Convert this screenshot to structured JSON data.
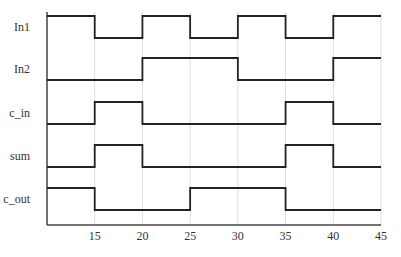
{
  "diagram": {
    "type": "timing-diagram",
    "x_axis": {
      "min": 10,
      "max": 45,
      "ticks": [
        15,
        20,
        25,
        30,
        35,
        40,
        45
      ],
      "tick_labels": [
        "15",
        "20",
        "25",
        "30",
        "35",
        "40",
        "45"
      ]
    },
    "signals": [
      {
        "name": "In1",
        "label": "In1",
        "transitions": [
          [
            10,
            1
          ],
          [
            15,
            0
          ],
          [
            20,
            1
          ],
          [
            25,
            0
          ],
          [
            30,
            1
          ],
          [
            35,
            0
          ],
          [
            40,
            1
          ]
        ]
      },
      {
        "name": "In2",
        "label": "In2",
        "transitions": [
          [
            10,
            0
          ],
          [
            20,
            1
          ],
          [
            30,
            0
          ],
          [
            40,
            1
          ]
        ]
      },
      {
        "name": "c_in",
        "label": "c_in",
        "transitions": [
          [
            10,
            0
          ],
          [
            15,
            1
          ],
          [
            20,
            0
          ],
          [
            35,
            1
          ],
          [
            40,
            0
          ]
        ]
      },
      {
        "name": "sum",
        "label": "sum",
        "transitions": [
          [
            10,
            0
          ],
          [
            15,
            1
          ],
          [
            20,
            0
          ],
          [
            35,
            1
          ],
          [
            40,
            0
          ]
        ]
      },
      {
        "name": "c_out",
        "label": "c_out",
        "transitions": [
          [
            10,
            1
          ],
          [
            15,
            0
          ],
          [
            25,
            1
          ],
          [
            35,
            0
          ]
        ]
      }
    ],
    "colors": {
      "wave": "#222222",
      "grid": "#dddddd",
      "axis": "#444444"
    }
  }
}
